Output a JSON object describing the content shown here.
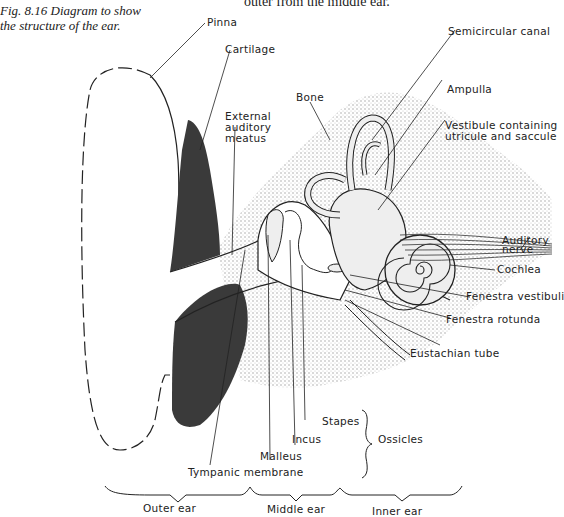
{
  "caption": {
    "line1": "Fig. 8.16  Diagram to show",
    "line2": "the structure of the ear."
  },
  "top_text": "outer from the middle ear.",
  "labels": {
    "pinna": "Pinna",
    "cartilage": "Cartilage",
    "bone": "Bone",
    "external_meatus_1": "External",
    "external_meatus_2": "auditory",
    "external_meatus_3": "meatus",
    "semicircular_canal": "Semicircular  canal",
    "ampulla": "Ampulla",
    "vestibule_1": "Vestibule containing",
    "vestibule_2": "utricule and saccule",
    "auditory_nerve_1": "Auditory",
    "auditory_nerve_2": "nerve",
    "cochlea": "Cochlea",
    "fenestra_vestibuli": "Fenestra vestibuli",
    "fenestra_rotunda": "Fenestra rotunda",
    "eustachian_tube": "Eustachian tube",
    "stapes": "Stapes",
    "incus": "Incus",
    "malleus": "Malleus",
    "ossicles": "Ossicles",
    "tympanic_membrane": "Tympanic membrane"
  },
  "regions": {
    "outer_ear": "Outer ear",
    "middle_ear": "Middle ear",
    "inner_ear": "Inner ear"
  },
  "colors": {
    "cartilage_fill": "#3a3a3a",
    "bone_stipple": "#c8c8c8",
    "line": "#222222"
  }
}
